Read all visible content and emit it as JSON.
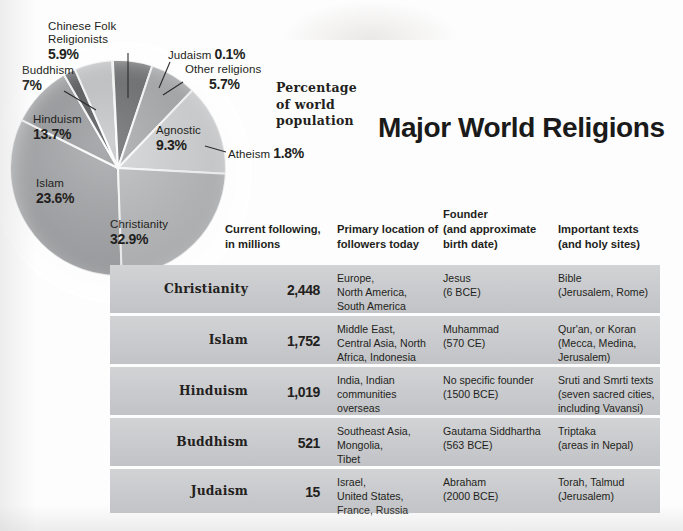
{
  "title": "Major World Religions",
  "pie_caption": [
    "Percentage",
    "of world",
    "population"
  ],
  "chart_data": {
    "type": "pie",
    "title": "Percentage of world population",
    "legend": "labels-on-slices",
    "unit": "%",
    "categories": [
      "Christianity",
      "Islam",
      "Hinduism",
      "Buddhism",
      "Chinese Folk Religionists",
      "Judaism",
      "Other religions",
      "Agnostic",
      "Atheism"
    ],
    "values": [
      32.9,
      23.6,
      13.7,
      7.0,
      5.9,
      0.1,
      5.7,
      9.3,
      1.8
    ],
    "labels": [
      {
        "name": "Christianity",
        "pct": "32.9%",
        "value": 32.9,
        "color": "#a7a9ac"
      },
      {
        "name": "Islam",
        "pct": "23.6%",
        "value": 23.6,
        "color": "#bcbec0"
      },
      {
        "name": "Hinduism",
        "pct": "13.7%",
        "value": 13.7,
        "color": "#d6d7d9"
      },
      {
        "name": "Buddhism",
        "pct": "7%",
        "value": 7.0,
        "color": "#a9abad"
      },
      {
        "name": "Chinese Folk Religionists",
        "pct": "5.9%",
        "value": 5.9,
        "color": "#6d6e70"
      },
      {
        "name": "Judaism",
        "pct": "0.1%",
        "value": 0.1,
        "color": "#e6e7e8"
      },
      {
        "name": "Other religions",
        "pct": "5.7%",
        "value": 5.7,
        "color": "#c6c7c9"
      },
      {
        "name": "Agnostic",
        "pct": "9.3%",
        "value": 9.3,
        "color": "#9b9da0"
      },
      {
        "name": "Atheism",
        "pct": "1.8%",
        "value": 1.8,
        "color": "#58595b"
      }
    ]
  },
  "table": {
    "headers": [
      {
        "key": "religion",
        "lines": [
          ""
        ]
      },
      {
        "key": "following",
        "lines": [
          "Current following,",
          "in millions"
        ]
      },
      {
        "key": "location",
        "lines": [
          "Primary location of",
          "followers today"
        ]
      },
      {
        "key": "founder",
        "lines": [
          "Founder",
          "(and approximate",
          "birth date)"
        ]
      },
      {
        "key": "texts",
        "lines": [
          "Important texts",
          "(and holy sites)"
        ]
      }
    ],
    "rows": [
      {
        "religion": "Christianity",
        "number": "2,448",
        "location": [
          "Europe,",
          "North America,",
          "South America"
        ],
        "founder": [
          "Jesus",
          "(6 BCE)"
        ],
        "texts": [
          "Bible",
          "(Jerusalem, Rome)"
        ]
      },
      {
        "religion": "Islam",
        "number": "1,752",
        "location": [
          "Middle East,",
          "Central Asia, North",
          "Africa, Indonesia"
        ],
        "founder": [
          "Muhammad",
          "(570 CE)"
        ],
        "texts": [
          "Qur'an, or Koran",
          "(Mecca, Medina,",
          "Jerusalem)"
        ]
      },
      {
        "religion": "Hinduism",
        "number": "1,019",
        "location": [
          "India, Indian",
          "communities",
          "overseas"
        ],
        "founder": [
          "No specific founder",
          "(1500 BCE)"
        ],
        "texts": [
          "Sruti and Smrti texts",
          "(seven sacred cities,",
          "including Vavansi)"
        ]
      },
      {
        "religion": "Buddhism",
        "number": "521",
        "location": [
          "Southeast Asia,",
          "Mongolia,",
          "Tibet"
        ],
        "founder": [
          "Gautama Siddhartha",
          "(563 BCE)"
        ],
        "texts": [
          "Triptaka",
          "(areas in Nepal)"
        ]
      },
      {
        "religion": "Judaism",
        "number": "15",
        "location": [
          "Israel,",
          "United States,",
          "France, Russia"
        ],
        "founder": [
          "Abraham",
          "(2000 BCE)"
        ],
        "texts": [
          "Torah, Talmud",
          "(Jerusalem)"
        ]
      }
    ]
  },
  "colors": {
    "row_background": "#c9cacd",
    "row_divider": "#ffffff",
    "text": "#231f20",
    "page": "#fdfdfd"
  }
}
